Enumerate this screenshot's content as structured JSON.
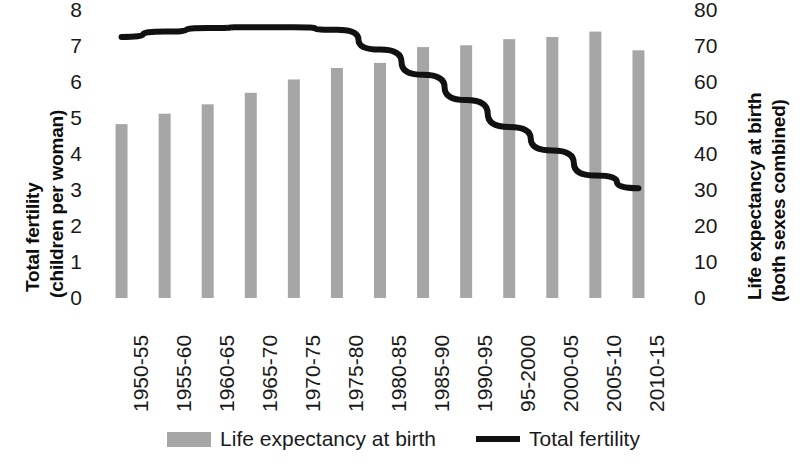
{
  "chart_data": {
    "type": "bar",
    "title": "",
    "subtitle": "",
    "xlabel": "",
    "categories": [
      "1950-55",
      "1955-60",
      "1960-65",
      "1965-70",
      "1970-75",
      "1975-80",
      "1980-85",
      "1985-90",
      "1990-95",
      "95-2000",
      "2000-05",
      "2005-10",
      "2010-15"
    ],
    "series": [
      {
        "name": "Life expectancy at birth",
        "type": "bar",
        "axis": "right",
        "color": "#a6a6a6",
        "values": [
          48.3,
          51.2,
          53.8,
          57.0,
          60.7,
          63.9,
          65.3,
          69.7,
          70.2,
          71.9,
          72.5,
          74.0,
          68.8
        ]
      },
      {
        "name": "Total fertility",
        "type": "line",
        "axis": "left",
        "color": "#111111",
        "values": [
          7.25,
          7.4,
          7.5,
          7.52,
          7.52,
          7.45,
          6.9,
          6.2,
          5.5,
          4.75,
          4.1,
          3.4,
          3.05
        ]
      }
    ],
    "axes": {
      "left": {
        "title_line1": "Total fertility",
        "title_line2": "(children per woman)",
        "ticks": [
          8,
          7,
          6,
          5,
          4,
          3,
          2,
          1,
          0
        ],
        "min": 0,
        "max": 8
      },
      "right": {
        "title_line1": "Life expectancy at birth",
        "title_line2": "(both sexes combined)",
        "ticks": [
          80,
          70,
          60,
          50,
          40,
          30,
          20,
          10,
          0
        ],
        "min": 0,
        "max": 80
      }
    },
    "grid": false,
    "legend": {
      "position": "bottom",
      "entries": [
        {
          "label": "Life expectancy at birth",
          "marker": "bar-swatch",
          "color": "#a6a6a6"
        },
        {
          "label": "Total fertility",
          "marker": "line-swatch",
          "color": "#111111"
        }
      ]
    }
  }
}
